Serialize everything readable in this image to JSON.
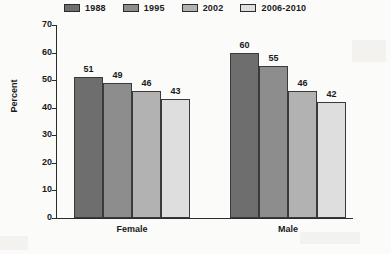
{
  "chart_data": {
    "type": "bar",
    "title": "",
    "xlabel": "",
    "ylabel": "Percent",
    "ylim": [
      0,
      70
    ],
    "yticks": [
      0,
      10,
      20,
      30,
      40,
      50,
      60,
      70
    ],
    "grid": false,
    "legend_position": "top",
    "categories": [
      "Female",
      "Male"
    ],
    "series": [
      {
        "name": "1988",
        "values": [
          51,
          60
        ],
        "color": "#6e6e6e"
      },
      {
        "name": "1995",
        "values": [
          49,
          55
        ],
        "color": "#8d8d8d"
      },
      {
        "name": "2002",
        "values": [
          46,
          46
        ],
        "color": "#b2b2b2"
      },
      {
        "name": "2006-2010",
        "values": [
          43,
          42
        ],
        "color": "#dedede"
      }
    ]
  }
}
